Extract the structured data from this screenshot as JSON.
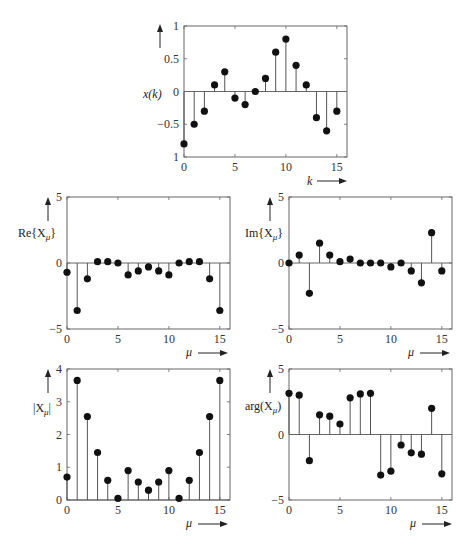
{
  "chart_data": [
    {
      "id": "xk",
      "type": "stem",
      "title": "",
      "ylabel": "x(k)",
      "xlabel": "k",
      "x": [
        0,
        1,
        2,
        3,
        4,
        5,
        6,
        7,
        8,
        9,
        10,
        11,
        12,
        13,
        14,
        15
      ],
      "values": [
        -0.8,
        -0.5,
        -0.3,
        0.1,
        0.3,
        -0.1,
        -0.2,
        0.0,
        0.2,
        0.6,
        0.8,
        0.4,
        0.1,
        -0.4,
        -0.6,
        -0.3
      ],
      "xlim": [
        0,
        16
      ],
      "ylim": [
        -1,
        1
      ],
      "xticks": [
        0,
        5,
        10,
        15
      ],
      "yticks": [
        -1,
        -0.5,
        0,
        0.5,
        1
      ],
      "ytick_labels": [
        "1",
        "-0.5",
        "0",
        "0.5",
        "1"
      ],
      "baseline": 0,
      "box": {
        "x0": 184,
        "y0": 26,
        "x1": 347,
        "y1": 157
      }
    },
    {
      "id": "re",
      "type": "stem",
      "ylabel": "Re{Xμ}",
      "xlabel": "μ",
      "x": [
        0,
        1,
        2,
        3,
        4,
        5,
        6,
        7,
        8,
        9,
        10,
        11,
        12,
        13,
        14,
        15
      ],
      "values": [
        -0.7,
        -3.6,
        -1.2,
        0.1,
        0.1,
        0.0,
        -0.9,
        -0.6,
        -0.3,
        -0.6,
        -0.9,
        0.0,
        0.1,
        0.1,
        -1.2,
        -3.6
      ],
      "xlim": [
        0,
        16
      ],
      "ylim": [
        -5,
        5
      ],
      "xticks": [
        0,
        5,
        10,
        15
      ],
      "yticks": [
        -5,
        0,
        5
      ],
      "ytick_labels": [
        "-5",
        "0",
        "5"
      ],
      "baseline": 0,
      "box": {
        "x0": 67,
        "y0": 197,
        "x1": 230,
        "y1": 329
      }
    },
    {
      "id": "im",
      "type": "stem",
      "ylabel": "Im{Xμ}",
      "xlabel": "μ",
      "x": [
        0,
        1,
        2,
        3,
        4,
        5,
        6,
        7,
        8,
        9,
        10,
        11,
        12,
        13,
        14,
        15
      ],
      "values": [
        0.0,
        0.6,
        -2.3,
        1.5,
        0.6,
        0.1,
        0.3,
        0.0,
        0.0,
        0.0,
        -0.3,
        0.0,
        -0.6,
        -1.5,
        2.3,
        -0.6
      ],
      "xlim": [
        0,
        16
      ],
      "ylim": [
        -5,
        5
      ],
      "xticks": [
        0,
        5,
        10,
        15
      ],
      "yticks": [
        -5,
        0,
        5
      ],
      "ytick_labels": [
        "-5",
        "0",
        "5"
      ],
      "baseline": 0,
      "box": {
        "x0": 289,
        "y0": 197,
        "x1": 452,
        "y1": 329
      }
    },
    {
      "id": "mag",
      "type": "stem",
      "ylabel": "|Xμ|",
      "xlabel": "μ",
      "x": [
        0,
        1,
        2,
        3,
        4,
        5,
        6,
        7,
        8,
        9,
        10,
        11,
        12,
        13,
        14,
        15
      ],
      "values": [
        0.7,
        3.65,
        2.55,
        1.45,
        0.6,
        0.05,
        0.9,
        0.55,
        0.3,
        0.55,
        0.9,
        0.05,
        0.6,
        1.45,
        2.55,
        3.65
      ],
      "xlim": [
        0,
        16
      ],
      "ylim": [
        0,
        4
      ],
      "xticks": [
        0,
        5,
        10,
        15
      ],
      "yticks": [
        0,
        1,
        2,
        3,
        4
      ],
      "ytick_labels": [
        "0",
        "1",
        "2",
        "3",
        "4"
      ],
      "baseline": 0,
      "box": {
        "x0": 67,
        "y0": 369,
        "x1": 230,
        "y1": 500
      }
    },
    {
      "id": "arg",
      "type": "stem",
      "ylabel": "arg(Xμ)",
      "xlabel": "μ",
      "x": [
        0,
        1,
        2,
        3,
        4,
        5,
        6,
        7,
        8,
        9,
        10,
        11,
        12,
        13,
        14,
        15
      ],
      "values": [
        3.14,
        3.0,
        -2.0,
        1.5,
        1.4,
        0.8,
        2.8,
        3.1,
        3.14,
        -3.1,
        -2.8,
        -0.8,
        -1.4,
        -1.5,
        2.0,
        -3.0
      ],
      "xlim": [
        0,
        16
      ],
      "ylim": [
        -5,
        5
      ],
      "xticks": [
        0,
        5,
        10,
        15
      ],
      "yticks": [
        -5,
        0,
        5
      ],
      "ytick_labels": [
        "-5",
        "0",
        "5"
      ],
      "baseline": 0,
      "box": {
        "x0": 289,
        "y0": 369,
        "x1": 452,
        "y1": 500
      }
    }
  ],
  "labels": {
    "xk_y": "x(k)",
    "xk_x": "k",
    "re_y_prefix": "Re{X",
    "re_y_sub": "μ",
    "re_y_suffix": "}",
    "im_y_prefix": "Im{X",
    "im_y_sub": "μ",
    "im_y_suffix": "}",
    "mag_y_prefix": "|X",
    "mag_y_sub": "μ",
    "mag_y_suffix": "|",
    "arg_y_prefix": "arg(X",
    "arg_y_sub": "μ",
    "arg_y_suffix": ")",
    "mu": "μ"
  },
  "colors": {
    "stem": "#555555",
    "marker": "#111111",
    "axis": "#666666",
    "text": "#222222"
  }
}
